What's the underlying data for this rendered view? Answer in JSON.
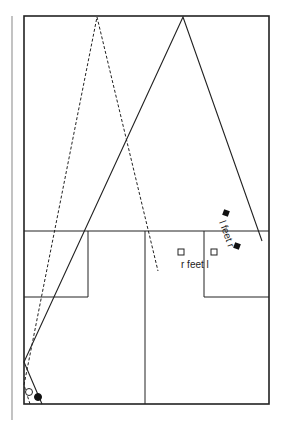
{
  "diagram": {
    "type": "court-play-diagram",
    "labels": {
      "l_feet_r": "l feet r",
      "r_feet_l": "r feet l"
    },
    "colors": {
      "line": "#222222",
      "margin_line": "#9a9a9a",
      "background": "#ffffff"
    },
    "players": [
      {
        "id": "open-circle",
        "shape": "circle",
        "fill": "open",
        "x": 29,
        "y": 392
      },
      {
        "id": "filled-circle",
        "shape": "circle",
        "fill": "solid",
        "x": 38,
        "y": 397
      }
    ],
    "markers": [
      {
        "id": "l-foot-marker",
        "shape": "square",
        "fill": "solid",
        "x": 226,
        "y": 213
      },
      {
        "id": "r-foot-marker",
        "shape": "square",
        "fill": "solid",
        "x": 237,
        "y": 246
      },
      {
        "id": "r-foot-open-marker",
        "shape": "square",
        "fill": "open",
        "x": 181,
        "y": 252
      },
      {
        "id": "l-foot-open-marker",
        "shape": "square",
        "fill": "open",
        "x": 214,
        "y": 252
      }
    ]
  }
}
